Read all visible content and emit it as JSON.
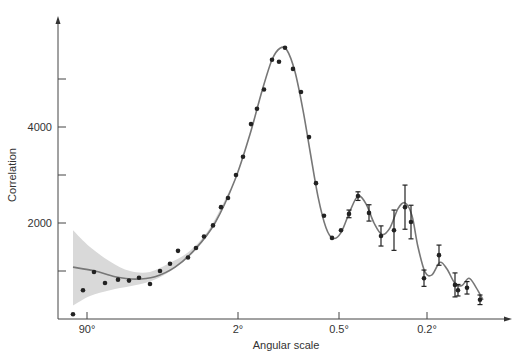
{
  "chart_data": {
    "type": "scatter",
    "title": "",
    "xlabel": "Angular scale",
    "ylabel": "Correlation",
    "x_scale": "log (angular scale, decreasing to the right)",
    "x_ticks": [
      {
        "label": "90°",
        "px": 87
      },
      {
        "label": "2°",
        "px": 238
      },
      {
        "label": "0.5°",
        "px": 339
      },
      {
        "label": "0.2°",
        "px": 427
      }
    ],
    "y_ticks": [
      {
        "label": "",
        "value": 1000
      },
      {
        "label": "2000",
        "value": 2000
      },
      {
        "label": "",
        "value": 3000
      },
      {
        "label": "4000",
        "value": 4000
      },
      {
        "label": "",
        "value": 5000
      }
    ],
    "ylim": [
      0,
      5900
    ],
    "grid": false,
    "legend": null,
    "series": [
      {
        "name": "measurements",
        "kind": "points",
        "points": [
          {
            "px": 73,
            "y": 100
          },
          {
            "px": 83,
            "y": 600
          },
          {
            "px": 94,
            "y": 980
          },
          {
            "px": 105,
            "y": 750
          },
          {
            "px": 118,
            "y": 820
          },
          {
            "px": 129,
            "y": 800
          },
          {
            "px": 139,
            "y": 860
          },
          {
            "px": 150,
            "y": 730
          },
          {
            "px": 160,
            "y": 1000
          },
          {
            "px": 170,
            "y": 1150
          },
          {
            "px": 178,
            "y": 1420
          },
          {
            "px": 188,
            "y": 1280
          },
          {
            "px": 196,
            "y": 1480
          },
          {
            "px": 204,
            "y": 1720
          },
          {
            "px": 213,
            "y": 1950
          },
          {
            "px": 221,
            "y": 2330
          },
          {
            "px": 228,
            "y": 2520
          },
          {
            "px": 236,
            "y": 3000
          },
          {
            "px": 243,
            "y": 3380
          },
          {
            "px": 251,
            "y": 4060
          },
          {
            "px": 257,
            "y": 4380
          },
          {
            "px": 264,
            "y": 4780
          },
          {
            "px": 272,
            "y": 5400
          },
          {
            "px": 279,
            "y": 5360
          },
          {
            "px": 285,
            "y": 5650
          },
          {
            "px": 293,
            "y": 5210
          },
          {
            "px": 301,
            "y": 4730
          },
          {
            "px": 309,
            "y": 3790
          },
          {
            "px": 316,
            "y": 2830
          },
          {
            "px": 324,
            "y": 2150
          },
          {
            "px": 332,
            "y": 1690
          },
          {
            "px": 341,
            "y": 1850
          }
        ]
      },
      {
        "name": "measurements with error bars",
        "kind": "errorbars",
        "points": [
          {
            "px": 349,
            "y": 2190,
            "err": 80
          },
          {
            "px": 358,
            "y": 2560,
            "err": 90
          },
          {
            "px": 369,
            "y": 2210,
            "err": 170
          },
          {
            "px": 381,
            "y": 1730,
            "err": 210
          },
          {
            "px": 394,
            "y": 1850,
            "err": 420
          },
          {
            "px": 405,
            "y": 2330,
            "err": 460
          },
          {
            "px": 411,
            "y": 2020,
            "err": 350
          },
          {
            "px": 424,
            "y": 850,
            "err": 170
          },
          {
            "px": 439,
            "y": 1330,
            "err": 210
          },
          {
            "px": 455,
            "y": 710,
            "err": 250
          },
          {
            "px": 458,
            "y": 600,
            "err": 120
          },
          {
            "px": 467,
            "y": 650,
            "err": 130
          },
          {
            "px": 480,
            "y": 400,
            "err": 100
          }
        ]
      },
      {
        "name": "model fit",
        "kind": "line",
        "points": [
          {
            "px": 73,
            "y": 1080
          },
          {
            "px": 95,
            "y": 1000
          },
          {
            "px": 115,
            "y": 880
          },
          {
            "px": 135,
            "y": 830
          },
          {
            "px": 155,
            "y": 880
          },
          {
            "px": 175,
            "y": 1080
          },
          {
            "px": 195,
            "y": 1450
          },
          {
            "px": 215,
            "y": 2000
          },
          {
            "px": 235,
            "y": 2900
          },
          {
            "px": 250,
            "y": 3850
          },
          {
            "px": 262,
            "y": 4750
          },
          {
            "px": 272,
            "y": 5400
          },
          {
            "px": 280,
            "y": 5640
          },
          {
            "px": 287,
            "y": 5600
          },
          {
            "px": 295,
            "y": 5150
          },
          {
            "px": 303,
            "y": 4350
          },
          {
            "px": 310,
            "y": 3500
          },
          {
            "px": 318,
            "y": 2550
          },
          {
            "px": 326,
            "y": 1900
          },
          {
            "px": 333,
            "y": 1680
          },
          {
            "px": 341,
            "y": 1800
          },
          {
            "px": 350,
            "y": 2250
          },
          {
            "px": 358,
            "y": 2560
          },
          {
            "px": 366,
            "y": 2400
          },
          {
            "px": 374,
            "y": 2000
          },
          {
            "px": 382,
            "y": 1760
          },
          {
            "px": 390,
            "y": 1900
          },
          {
            "px": 398,
            "y": 2300
          },
          {
            "px": 405,
            "y": 2420
          },
          {
            "px": 412,
            "y": 2150
          },
          {
            "px": 418,
            "y": 1500
          },
          {
            "px": 425,
            "y": 980
          },
          {
            "px": 432,
            "y": 920
          },
          {
            "px": 440,
            "y": 1180
          },
          {
            "px": 447,
            "y": 1040
          },
          {
            "px": 455,
            "y": 740
          },
          {
            "px": 462,
            "y": 700
          },
          {
            "px": 469,
            "y": 850
          },
          {
            "px": 476,
            "y": 660
          },
          {
            "px": 483,
            "y": 400
          }
        ]
      },
      {
        "name": "cosmic variance band",
        "kind": "band",
        "upper": [
          {
            "px": 73,
            "y": 1850
          },
          {
            "px": 90,
            "y": 1500
          },
          {
            "px": 110,
            "y": 1200
          },
          {
            "px": 130,
            "y": 1000
          },
          {
            "px": 150,
            "y": 980
          },
          {
            "px": 170,
            "y": 1170
          },
          {
            "px": 190,
            "y": 1420
          },
          {
            "px": 210,
            "y": 1900
          },
          {
            "px": 230,
            "y": 2700
          }
        ],
        "lower": [
          {
            "px": 73,
            "y": 280
          },
          {
            "px": 90,
            "y": 480
          },
          {
            "px": 110,
            "y": 600
          },
          {
            "px": 130,
            "y": 680
          },
          {
            "px": 150,
            "y": 780
          },
          {
            "px": 170,
            "y": 990
          },
          {
            "px": 190,
            "y": 1320
          },
          {
            "px": 210,
            "y": 1820
          },
          {
            "px": 230,
            "y": 2620
          }
        ]
      }
    ]
  },
  "colors": {
    "axis": "#444444",
    "points": "#222222",
    "curve": "#777777",
    "band": "#d9d9d9",
    "text": "#333333"
  }
}
